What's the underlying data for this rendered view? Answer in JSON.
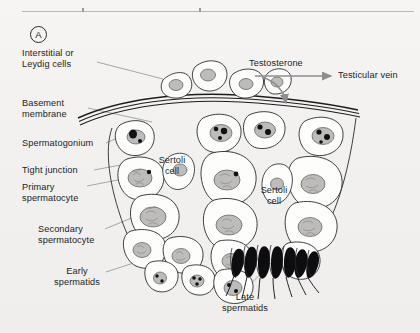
{
  "figure": {
    "panel_label": "A",
    "background_color": "#f3f2f0",
    "ink_color": "#1d1d1f",
    "arrow_color": "#8e8e90",
    "nucleus_fill": "#bdbcba",
    "chromatin_color": "#111113"
  },
  "labels": {
    "interstitial": "Interstitial or\nLeydig cells",
    "basement": "Basement\nmembrane",
    "spermatogonium": "Spermatogonium",
    "tight_junction": "Tight junction",
    "primary_spermatocyte": "Primary\nspermatocyte",
    "secondary_spermatocyte": "Secondary\nspermatocyte",
    "early_spermatids": "Early\nspermatids",
    "late_spermatids": "Late\nspermatids",
    "sertoli_left": "Sertoli\ncell",
    "sertoli_right": "Sertoli\ncell",
    "testosterone": "Testosterone",
    "testicular_vein": "Testicular vein"
  },
  "structures": {
    "leydig_cell_count": 4,
    "late_spermatid_count": 7,
    "basement_membrane_lines": 3
  }
}
